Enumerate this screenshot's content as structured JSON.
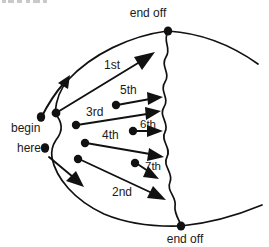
{
  "figure": {
    "title_fragment_top": "",
    "labels": {
      "begin_line1": "begin",
      "begin_line2": "here",
      "end_top": "end off",
      "end_bottom": "end off"
    },
    "order_labels": [
      {
        "id": "first",
        "text": "1st"
      },
      {
        "id": "second",
        "text": "2nd"
      },
      {
        "id": "third",
        "text": "3rd"
      },
      {
        "id": "fourth",
        "text": "4th"
      },
      {
        "id": "fifth",
        "text": "5th"
      },
      {
        "id": "sixth",
        "text": "6th"
      },
      {
        "id": "seventh",
        "text": "7th"
      }
    ],
    "colors": {
      "ink": "#111111",
      "text": "#1a1a1a",
      "background": "#ffffff"
    }
  }
}
